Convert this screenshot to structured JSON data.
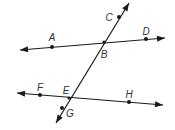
{
  "diagram": {
    "colors": {
      "line": "#1a1a1a",
      "label": "#333333",
      "background": "#ffffff"
    },
    "lines": [
      {
        "name": "line-AD",
        "from": [
          20,
          50
        ],
        "to": [
          165,
          38
        ],
        "arrows": "both"
      },
      {
        "name": "line-FH",
        "from": [
          17,
          93
        ],
        "to": [
          163,
          105
        ],
        "arrows": "both"
      },
      {
        "name": "transversal-CG",
        "from": [
          129,
          3
        ],
        "to": [
          56,
          123
        ],
        "arrows": "both"
      }
    ],
    "points": [
      {
        "id": "A",
        "label": "A",
        "x": 52,
        "y": 47,
        "lx": 52,
        "ly": 38
      },
      {
        "id": "B",
        "label": "B",
        "x": 104,
        "y": 42,
        "lx": 104,
        "ly": 55,
        "intersection": true
      },
      {
        "id": "C",
        "label": "C",
        "x": 119,
        "y": 17,
        "lx": 109,
        "ly": 18
      },
      {
        "id": "D",
        "label": "D",
        "x": 146,
        "y": 39,
        "lx": 146,
        "ly": 32
      },
      {
        "id": "E",
        "label": "E",
        "x": 69,
        "y": 98,
        "lx": 66,
        "ly": 91,
        "intersection": true
      },
      {
        "id": "F",
        "label": "F",
        "x": 40,
        "y": 95,
        "lx": 40,
        "ly": 88
      },
      {
        "id": "G",
        "label": "G",
        "x": 62,
        "y": 108,
        "lx": 70,
        "ly": 114
      },
      {
        "id": "H",
        "label": "H",
        "x": 129,
        "y": 102,
        "lx": 129,
        "ly": 95
      }
    ]
  }
}
